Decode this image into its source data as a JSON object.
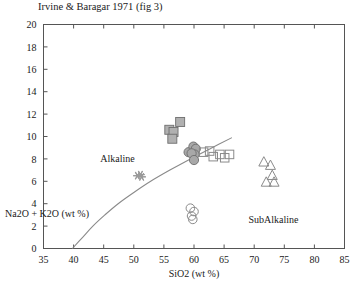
{
  "chart_data": {
    "type": "scatter",
    "title": "Irvine & Baragar 1971 (fig 3)",
    "xlabel": "SiO2  (wt %)",
    "ylabel": "Na2O + K2O  (wt %)",
    "xlim": [
      35,
      85
    ],
    "ylim": [
      0,
      20
    ],
    "xticks": [
      35,
      40,
      45,
      50,
      55,
      60,
      65,
      70,
      75,
      80,
      85
    ],
    "yticks": [
      0,
      2,
      4,
      6,
      8,
      10,
      12,
      14,
      16,
      18,
      20
    ],
    "grid": false,
    "legend": "none",
    "annotations": [
      {
        "text": "Alkaline",
        "x": 47.3,
        "y": 7.7
      },
      {
        "text": "SubAlkaline",
        "x": 73.2,
        "y": 2.3
      }
    ],
    "divider_curve": {
      "name": "Alkaline / SubAlkaline divide",
      "points": [
        {
          "x": 39.8,
          "y": 0.0
        },
        {
          "x": 41.5,
          "y": 1.0
        },
        {
          "x": 43.2,
          "y": 2.0
        },
        {
          "x": 45.2,
          "y": 3.0
        },
        {
          "x": 47.4,
          "y": 4.0
        },
        {
          "x": 50.0,
          "y": 5.0
        },
        {
          "x": 52.8,
          "y": 6.0
        },
        {
          "x": 56.0,
          "y": 7.0
        },
        {
          "x": 59.4,
          "y": 8.0
        },
        {
          "x": 63.0,
          "y": 9.0
        },
        {
          "x": 66.3,
          "y": 9.9
        }
      ]
    },
    "series": [
      {
        "name": "filled-gray-squares",
        "marker": "square",
        "fill": "#b0b0b0",
        "edge": "#6e6e6e",
        "points": [
          {
            "x": 55.9,
            "y": 10.6
          },
          {
            "x": 56.6,
            "y": 10.4
          },
          {
            "x": 56.4,
            "y": 9.8
          },
          {
            "x": 57.7,
            "y": 11.3
          }
        ]
      },
      {
        "name": "filled-gray-circles",
        "marker": "circle",
        "fill": "#a8a8a8",
        "edge": "#6e6e6e",
        "points": [
          {
            "x": 59.1,
            "y": 8.6
          },
          {
            "x": 59.9,
            "y": 9.1
          },
          {
            "x": 60.3,
            "y": 8.9
          },
          {
            "x": 60.1,
            "y": 8.4
          },
          {
            "x": 59.6,
            "y": 8.5
          },
          {
            "x": 60.0,
            "y": 7.9
          }
        ]
      },
      {
        "name": "open-squares",
        "marker": "square",
        "fill": "none",
        "edge": "#8a8a8a",
        "points": [
          {
            "x": 61.6,
            "y": 8.6
          },
          {
            "x": 62.6,
            "y": 8.7
          },
          {
            "x": 63.2,
            "y": 8.2
          },
          {
            "x": 64.3,
            "y": 8.4
          },
          {
            "x": 65.1,
            "y": 8.1
          },
          {
            "x": 65.9,
            "y": 8.4
          }
        ]
      },
      {
        "name": "open-circles",
        "marker": "circle",
        "fill": "none",
        "edge": "#8a8a8a",
        "points": [
          {
            "x": 59.4,
            "y": 3.6
          },
          {
            "x": 60.0,
            "y": 3.3
          },
          {
            "x": 59.6,
            "y": 2.9
          },
          {
            "x": 59.8,
            "y": 2.6
          }
        ]
      },
      {
        "name": "open-triangles",
        "marker": "triangle",
        "fill": "none",
        "edge": "#8a8a8a",
        "points": [
          {
            "x": 71.6,
            "y": 7.7
          },
          {
            "x": 72.7,
            "y": 7.4
          },
          {
            "x": 73.0,
            "y": 6.5
          },
          {
            "x": 72.0,
            "y": 5.9
          },
          {
            "x": 73.3,
            "y": 5.9
          }
        ]
      },
      {
        "name": "gray-asterisks",
        "marker": "asterisk",
        "fill": "#9a9a9a",
        "edge": "#9a9a9a",
        "points": [
          {
            "x": 50.6,
            "y": 6.5
          },
          {
            "x": 51.1,
            "y": 6.6
          },
          {
            "x": 51.3,
            "y": 6.4
          }
        ]
      }
    ]
  },
  "colors": {
    "frame": "#555555",
    "curve": "#8a8a8a",
    "marker_fill_gray": "#ababab",
    "marker_edge_gray": "#6e6e6e",
    "open_edge": "#8a8a8a",
    "text": "#1a1a1a"
  }
}
